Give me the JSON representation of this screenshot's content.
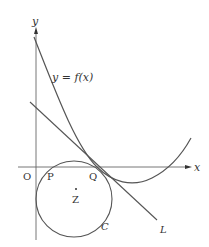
{
  "diagram": {
    "axes": {
      "x_label": "x",
      "y_label": "y",
      "origin_label": "O"
    },
    "curve": {
      "label": "y = f(x)"
    },
    "points": {
      "P": "P",
      "Q": "Q",
      "Z": "Z"
    },
    "circle": {
      "label": "C"
    },
    "line": {
      "label": "L"
    },
    "colors": {
      "stroke": "#555555",
      "text": "#333333",
      "background": "#ffffff"
    }
  }
}
